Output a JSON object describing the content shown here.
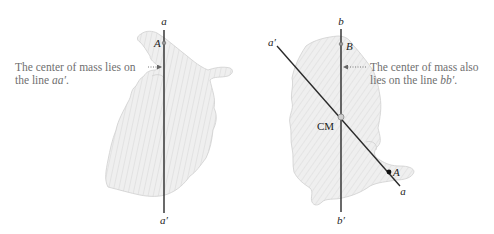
{
  "left_panel": {
    "line_top_label": "a",
    "line_bottom_label": "a′",
    "point_label": "A",
    "annotation": {
      "line1": "The center of mass lies on",
      "line2_prefix": "the line ",
      "line2_italic": "aa′",
      "line2_suffix": "."
    }
  },
  "right_panel": {
    "vertical_top_label": "b",
    "vertical_bottom_label": "b′",
    "diagonal_top_label": "a′",
    "diagonal_bottom_label": "a",
    "point_b_label": "B",
    "point_a_label": "A",
    "center_label": "CM",
    "annotation": {
      "line1": "The center of mass also",
      "line2_prefix": "lies on the line ",
      "line2_italic": "bb′",
      "line2_suffix": "."
    }
  },
  "colors": {
    "shape_fill": "#eeeeee",
    "hatch": "#d6d6d6",
    "line": "#2a2a2a",
    "annotation_text": "#6f6f6f"
  }
}
